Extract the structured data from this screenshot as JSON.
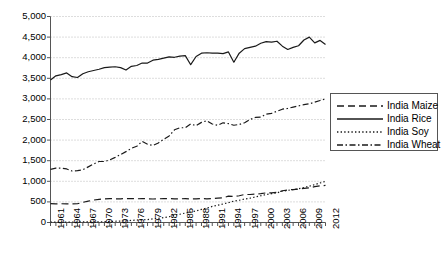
{
  "chart_data": {
    "type": "line",
    "title": "",
    "xlabel": "",
    "ylabel": "",
    "grid": true,
    "legend_position": "right",
    "xlim": [
      1961,
      2012
    ],
    "ylim": [
      0,
      5000
    ],
    "ytick_labels": [
      "0",
      "500",
      "1,000",
      "1,500",
      "2,000",
      "2,500",
      "3,000",
      "3,500",
      "4,000",
      "4,500",
      "5,000"
    ],
    "ytick_values": [
      0,
      500,
      1000,
      1500,
      2000,
      2500,
      3000,
      3500,
      4000,
      4500,
      5000
    ],
    "xtick_labels": [
      "1961",
      "1964",
      "1967",
      "1970",
      "1973",
      "1976",
      "1979",
      "1982",
      "1985",
      "1988",
      "1991",
      "1994",
      "1997",
      "2000",
      "2003",
      "2006",
      "2009",
      "2012"
    ],
    "xtick_values": [
      1961,
      1964,
      1967,
      1970,
      1973,
      1976,
      1979,
      1982,
      1985,
      1988,
      1991,
      1994,
      1997,
      2000,
      2003,
      2006,
      2009,
      2012
    ],
    "x": [
      1961,
      1962,
      1963,
      1964,
      1965,
      1966,
      1967,
      1968,
      1969,
      1970,
      1971,
      1972,
      1973,
      1974,
      1975,
      1976,
      1977,
      1978,
      1979,
      1980,
      1981,
      1982,
      1983,
      1984,
      1985,
      1986,
      1987,
      1988,
      1989,
      1990,
      1991,
      1992,
      1993,
      1994,
      1995,
      1996,
      1997,
      1998,
      1999,
      2000,
      2001,
      2002,
      2003,
      2004,
      2005,
      2006,
      2007,
      2008,
      2009,
      2010,
      2011,
      2012
    ],
    "series": [
      {
        "name": "India Maize",
        "dash": "dashed",
        "values": [
          460,
          450,
          455,
          450,
          450,
          455,
          490,
          520,
          545,
          560,
          575,
          580,
          575,
          575,
          580,
          580,
          575,
          580,
          575,
          570,
          575,
          580,
          580,
          575,
          575,
          580,
          570,
          575,
          580,
          575,
          580,
          590,
          600,
          640,
          630,
          650,
          680,
          680,
          690,
          700,
          720,
          720,
          730,
          770,
          790,
          800,
          810,
          830,
          840,
          870,
          890,
          900
        ]
      },
      {
        "name": "India Rice",
        "dash": "solid",
        "values": [
          3460,
          3560,
          3590,
          3630,
          3540,
          3520,
          3610,
          3660,
          3690,
          3720,
          3760,
          3770,
          3780,
          3760,
          3700,
          3790,
          3810,
          3870,
          3870,
          3940,
          3960,
          3990,
          4020,
          4010,
          4040,
          4050,
          3830,
          4030,
          4110,
          4120,
          4110,
          4110,
          4100,
          4140,
          3890,
          4110,
          4220,
          4250,
          4280,
          4350,
          4390,
          4380,
          4400,
          4280,
          4200,
          4250,
          4290,
          4430,
          4500,
          4360,
          4420,
          4320
        ]
      },
      {
        "name": "India Soy",
        "dash": "dotted",
        "values": [
          10,
          10,
          10,
          10,
          12,
          12,
          15,
          15,
          15,
          15,
          20,
          25,
          30,
          35,
          40,
          50,
          60,
          65,
          70,
          90,
          100,
          120,
          140,
          180,
          200,
          230,
          250,
          280,
          320,
          350,
          390,
          420,
          450,
          480,
          520,
          540,
          570,
          590,
          620,
          650,
          680,
          700,
          720,
          760,
          780,
          800,
          820,
          850,
          880,
          920,
          960,
          1000
        ]
      },
      {
        "name": "India Wheat",
        "dash": "dashdot",
        "values": [
          1290,
          1320,
          1320,
          1300,
          1250,
          1260,
          1280,
          1350,
          1420,
          1480,
          1480,
          1520,
          1580,
          1650,
          1720,
          1800,
          1850,
          1970,
          1900,
          1870,
          1930,
          2020,
          2100,
          2250,
          2300,
          2300,
          2390,
          2350,
          2430,
          2470,
          2390,
          2360,
          2420,
          2400,
          2360,
          2380,
          2420,
          2500,
          2550,
          2560,
          2630,
          2650,
          2700,
          2750,
          2770,
          2800,
          2830,
          2860,
          2880,
          2920,
          2960,
          3000
        ]
      }
    ]
  },
  "legend": {
    "items": [
      {
        "label": "India Maize"
      },
      {
        "label": "India Rice"
      },
      {
        "label": "India Soy"
      },
      {
        "label": "India Wheat"
      }
    ]
  }
}
